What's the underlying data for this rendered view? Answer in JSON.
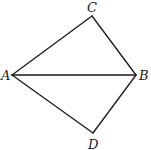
{
  "diagram": {
    "type": "geometry",
    "points": {
      "A": {
        "x": 12,
        "y": 75
      },
      "B": {
        "x": 136,
        "y": 75
      },
      "C": {
        "x": 92,
        "y": 16
      },
      "D": {
        "x": 93,
        "y": 133
      }
    },
    "segments": [
      "AC",
      "CB",
      "AB",
      "AD",
      "DB"
    ],
    "labels": {
      "A": "A",
      "B": "B",
      "C": "C",
      "D": "D"
    },
    "label_positions": {
      "A": {
        "x": 1,
        "y": 80
      },
      "B": {
        "x": 139,
        "y": 80
      },
      "C": {
        "x": 87,
        "y": 12
      },
      "D": {
        "x": 88,
        "y": 149
      }
    },
    "colors": {
      "stroke": "#1a1a1a",
      "background": "#ffffff"
    }
  }
}
